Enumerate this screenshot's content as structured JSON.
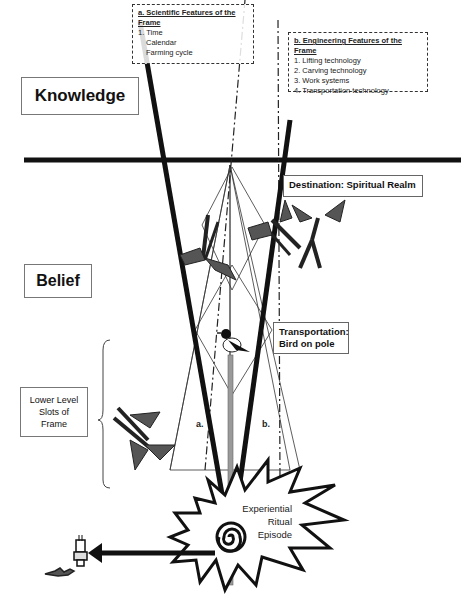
{
  "diagram": {
    "levels": {
      "knowledge": "Knowledge",
      "belief": "Belief",
      "lower_level": [
        "Lower Level",
        "Slots of",
        "Frame"
      ]
    },
    "scientific_features": {
      "title": "a. Scientific Features of the Frame",
      "items": [
        "1. Time",
        "Calendar",
        "Farming cycle"
      ]
    },
    "engineering_features": {
      "title": "b. Engineering Features of the Frame",
      "items": [
        "1. Lifting technology",
        "2. Carving technology",
        "3. Work systems",
        "4. Transportation technology"
      ]
    },
    "destination": "Destination: Spiritual Realm",
    "transportation": [
      "Transportation:",
      "Bird on pole"
    ],
    "cone_labels": {
      "a": "a.",
      "b": "b."
    },
    "ritual": [
      "Experiential",
      "Ritual",
      "Episode"
    ],
    "colors": {
      "line": "#111111",
      "pole": "#9a9a9a",
      "box_border": "#777777"
    }
  }
}
